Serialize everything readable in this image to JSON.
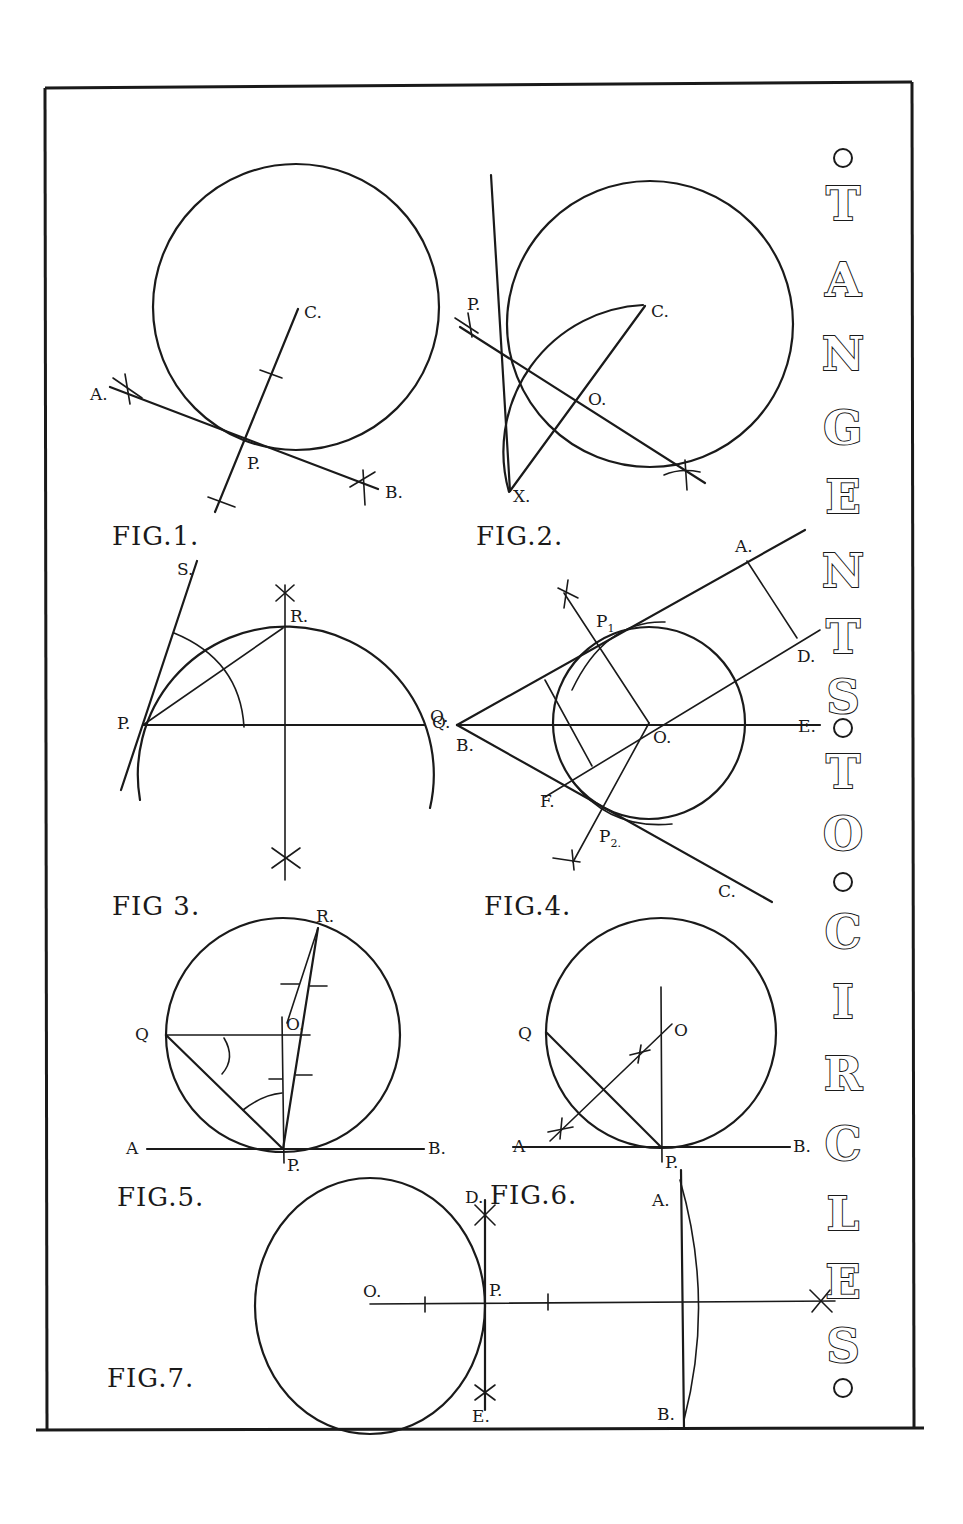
{
  "title": {
    "text": "TANGENTS TO CIRCLES",
    "letters": [
      "T",
      "A",
      "N",
      "G",
      "E",
      "N",
      "T",
      "S",
      "T",
      "O",
      "C",
      "I",
      "R",
      "C",
      "L",
      "E",
      "S"
    ]
  },
  "figures": {
    "fig1": {
      "caption": "FIG.1.",
      "labels": {
        "a": "A.",
        "b": "B.",
        "c": "C.",
        "p": "P."
      }
    },
    "fig2": {
      "caption": "FIG.2.",
      "labels": {
        "p": "P.",
        "c": "C.",
        "o": "O.",
        "x": "X."
      }
    },
    "fig3": {
      "caption": "FIG 3.",
      "labels": {
        "s": "S.",
        "r": "R.",
        "p": "P.",
        "q": "Q."
      }
    },
    "fig4": {
      "caption": "FIG.4.",
      "labels": {
        "a": "A.",
        "b": "B.",
        "q": "Q.",
        "d": "D.",
        "e": "E.",
        "o": "O.",
        "f": "F.",
        "c": "C.",
        "p1": "P",
        "p1_sub": "1",
        "p2": "P",
        "p2_sub": "2."
      }
    },
    "fig5": {
      "caption": "FIG.5.",
      "labels": {
        "r": "R.",
        "q": "Q",
        "o": "O.",
        "a": "A",
        "b": "B.",
        "p": "P."
      }
    },
    "fig6": {
      "caption": "FIG.6.",
      "labels": {
        "q": "Q",
        "o": "O",
        "a": "A",
        "b": "B.",
        "p": "P."
      }
    },
    "fig7": {
      "caption": "FIG.7.",
      "labels": {
        "o": "O.",
        "p": "P.",
        "d": "D.",
        "e": "E.",
        "a": "A.",
        "b": "B."
      }
    }
  }
}
